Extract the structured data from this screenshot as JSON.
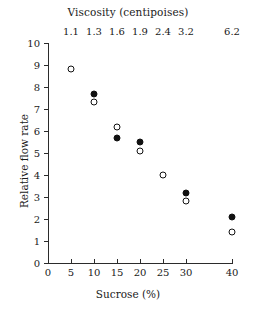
{
  "chart_data": {
    "type": "scatter",
    "title": "",
    "xlabel": "Sucrose (%)",
    "ylabel": "Relative flow rate",
    "top_axis_label": "Viscosity (centipoises)",
    "xlim": [
      0,
      40
    ],
    "ylim": [
      0,
      10
    ],
    "grid": false,
    "legend": "none",
    "x_ticks": [
      0,
      5,
      10,
      15,
      20,
      25,
      30,
      40
    ],
    "x_tick_labels": [
      "0",
      "5",
      "10",
      "15",
      "20",
      "25",
      "30",
      "40"
    ],
    "y_ticks": [
      0,
      1,
      2,
      3,
      4,
      5,
      6,
      7,
      8,
      9,
      10
    ],
    "y_tick_labels": [
      "0",
      "1",
      "2",
      "3",
      "4",
      "5",
      "6",
      "7",
      "8",
      "9",
      "10"
    ],
    "top_tick_positions": [
      5,
      10,
      15,
      20,
      25,
      30,
      40
    ],
    "top_tick_labels": [
      "1.1",
      "1.3",
      "1.6",
      "1.9",
      "2.4",
      "3.2",
      "6.2"
    ],
    "series": [
      {
        "name": "open-circles",
        "marker": "open-circle",
        "x": [
          5,
          10,
          15,
          20,
          25,
          30,
          40
        ],
        "values": [
          8.8,
          7.3,
          6.2,
          5.1,
          4.0,
          2.8,
          1.4
        ]
      },
      {
        "name": "filled-circles",
        "marker": "filled-circle",
        "x": [
          10,
          15,
          20,
          30,
          40
        ],
        "values": [
          7.7,
          5.7,
          5.5,
          3.2,
          2.1
        ]
      }
    ],
    "colors": {
      "marker": "#111111",
      "axis": "#2b2b2b",
      "background": "#ffffff"
    }
  }
}
